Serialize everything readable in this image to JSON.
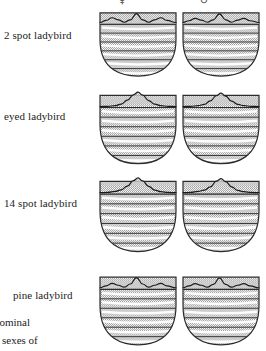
{
  "figure": {
    "title_visible": false,
    "columns": [
      {
        "id": "female",
        "symbol": "♀",
        "name": "female-column"
      },
      {
        "id": "male",
        "symbol": "♂",
        "name": "male-column"
      }
    ],
    "rows": [
      {
        "id": "two-spot",
        "label": "2 spot ladybird"
      },
      {
        "id": "eyed",
        "label": "eyed ladybird"
      },
      {
        "id": "fourteen-spot",
        "label": "14 spot ladybird"
      },
      {
        "id": "pine",
        "label": "pine ladybird"
      }
    ],
    "caption_fragments": [
      "dominal",
      "sexes of"
    ],
    "colors": {
      "stipple_fill": "#b8b8b8",
      "outline": "#2b2b2b",
      "curve": "#1a1a1a",
      "background": "#ffffff"
    }
  },
  "chart_data": {
    "type": "line",
    "xlabel": "",
    "ylabel": "",
    "grid": true,
    "legend_position": "none",
    "xlim": [
      0,
      100
    ],
    "ylim": [
      0,
      100
    ],
    "panel_layout": {
      "rows": 4,
      "cols": 2
    },
    "gridlines_y": [
      18,
      32,
      46,
      60,
      74,
      88
    ],
    "panels": [
      {
        "row": "2 spot ladybird",
        "col": "♀",
        "curve_shape": "bimodal",
        "x": [
          0,
          8,
          16,
          24,
          32,
          40,
          48,
          56,
          64,
          72,
          80,
          88,
          100
        ],
        "y": [
          12,
          26,
          44,
          30,
          14,
          30,
          72,
          30,
          14,
          30,
          44,
          26,
          12
        ]
      },
      {
        "row": "2 spot ladybird",
        "col": "♂",
        "curve_shape": "bimodal",
        "x": [
          0,
          8,
          16,
          24,
          32,
          40,
          48,
          56,
          64,
          72,
          80,
          88,
          100
        ],
        "y": [
          12,
          24,
          40,
          28,
          14,
          30,
          70,
          30,
          14,
          28,
          40,
          24,
          12
        ]
      },
      {
        "row": "eyed ladybird",
        "col": "♀",
        "curve_shape": "unimodal",
        "x": [
          0,
          10,
          20,
          28,
          36,
          44,
          50,
          56,
          64,
          72,
          80,
          90,
          100
        ],
        "y": [
          6,
          8,
          12,
          22,
          46,
          80,
          96,
          78,
          44,
          22,
          12,
          8,
          6
        ]
      },
      {
        "row": "eyed ladybird",
        "col": "♂",
        "curve_shape": "unimodal",
        "x": [
          0,
          10,
          20,
          28,
          36,
          44,
          50,
          56,
          64,
          72,
          80,
          90,
          100
        ],
        "y": [
          6,
          8,
          12,
          20,
          42,
          74,
          90,
          72,
          40,
          20,
          12,
          8,
          6
        ]
      },
      {
        "row": "14 spot ladybird",
        "col": "♀",
        "curve_shape": "unimodal",
        "x": [
          0,
          10,
          20,
          28,
          36,
          44,
          50,
          56,
          64,
          72,
          80,
          90,
          100
        ],
        "y": [
          8,
          10,
          16,
          26,
          48,
          82,
          98,
          80,
          46,
          24,
          14,
          10,
          8
        ]
      },
      {
        "row": "14 spot ladybird",
        "col": "♂",
        "curve_shape": "unimodal",
        "x": [
          0,
          10,
          20,
          28,
          36,
          44,
          50,
          56,
          64,
          72,
          80,
          90,
          100
        ],
        "y": [
          8,
          10,
          16,
          24,
          44,
          78,
          94,
          76,
          44,
          22,
          14,
          10,
          8
        ]
      },
      {
        "row": "pine ladybird",
        "col": "♀",
        "curve_shape": "bimodal",
        "x": [
          0,
          8,
          16,
          24,
          32,
          40,
          48,
          56,
          64,
          72,
          80,
          88,
          100
        ],
        "y": [
          10,
          22,
          38,
          26,
          14,
          34,
          74,
          34,
          14,
          26,
          38,
          22,
          10
        ]
      },
      {
        "row": "pine ladybird",
        "col": "♂",
        "curve_shape": "bimodal",
        "x": [
          0,
          8,
          16,
          24,
          32,
          40,
          48,
          56,
          64,
          72,
          80,
          88,
          100
        ],
        "y": [
          10,
          22,
          36,
          26,
          14,
          32,
          72,
          32,
          14,
          26,
          36,
          22,
          10
        ]
      }
    ]
  }
}
